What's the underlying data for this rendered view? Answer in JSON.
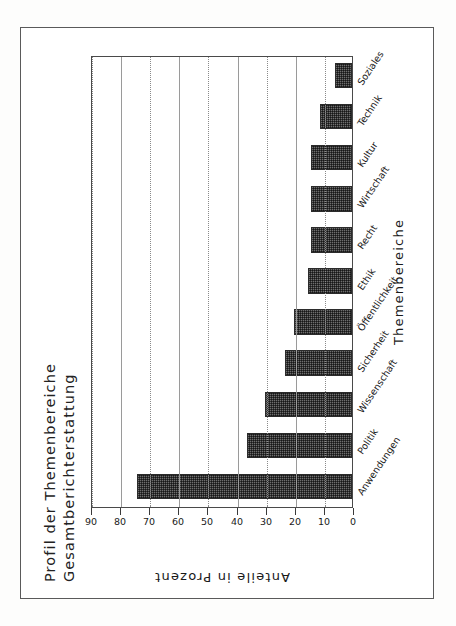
{
  "chart_data": {
    "type": "bar",
    "title": "Profil der Themenbereiche",
    "subtitle": "Gesamtberichterstattung",
    "xlabel": "Themenbereiche",
    "ylabel": "Anteile in Prozent",
    "ylim": [
      0,
      90
    ],
    "yticks": [
      0,
      10,
      20,
      30,
      40,
      50,
      60,
      70,
      80,
      90
    ],
    "grid": true,
    "legend": "none",
    "orientation": "rotated-90-ccw",
    "categories": [
      "Anwendungen",
      "Politik",
      "Wissenschaft",
      "Sicherheit",
      "Öffentlichkeit",
      "Ethik",
      "Recht",
      "Wirtschaft",
      "Kultur",
      "Technik",
      "Soziales"
    ],
    "values": [
      74,
      36,
      30,
      23,
      20,
      15,
      14,
      14,
      14,
      11,
      6
    ],
    "bar_color": "#6e6e6e",
    "bar_edge_color": "#2b2b2b"
  },
  "figure": {
    "title_line1": "Profil der Themenbereiche",
    "title_line2": "Gesamtberichterstattung",
    "axis_y_title": "Anteile in Prozent",
    "axis_x_title": "Themenbereiche"
  },
  "colors": {
    "frame": "#5a5a5a",
    "plot_border": "#4a4a4a",
    "gridline": "#8a8a8a",
    "text": "#1a1a1a",
    "page_background": "#fdfdfc"
  }
}
